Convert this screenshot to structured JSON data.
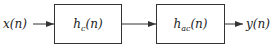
{
  "diagram": {
    "type": "block-diagram",
    "input": {
      "label": "x(n)"
    },
    "blocks": [
      {
        "name": "h",
        "subscript": "c",
        "arg": "(n)",
        "label": "h_c(n)"
      },
      {
        "name": "h",
        "subscript": "ac",
        "arg": "(n)",
        "label": "h_ac(n)"
      }
    ],
    "output": {
      "label": "y(n)"
    },
    "edges": [
      {
        "from": "x(n)",
        "to": "h_c(n)"
      },
      {
        "from": "h_c(n)",
        "to": "h_ac(n)"
      },
      {
        "from": "h_ac(n)",
        "to": "y(n)"
      }
    ],
    "colors": {
      "line": "#333333",
      "background": "#ffffff"
    }
  }
}
